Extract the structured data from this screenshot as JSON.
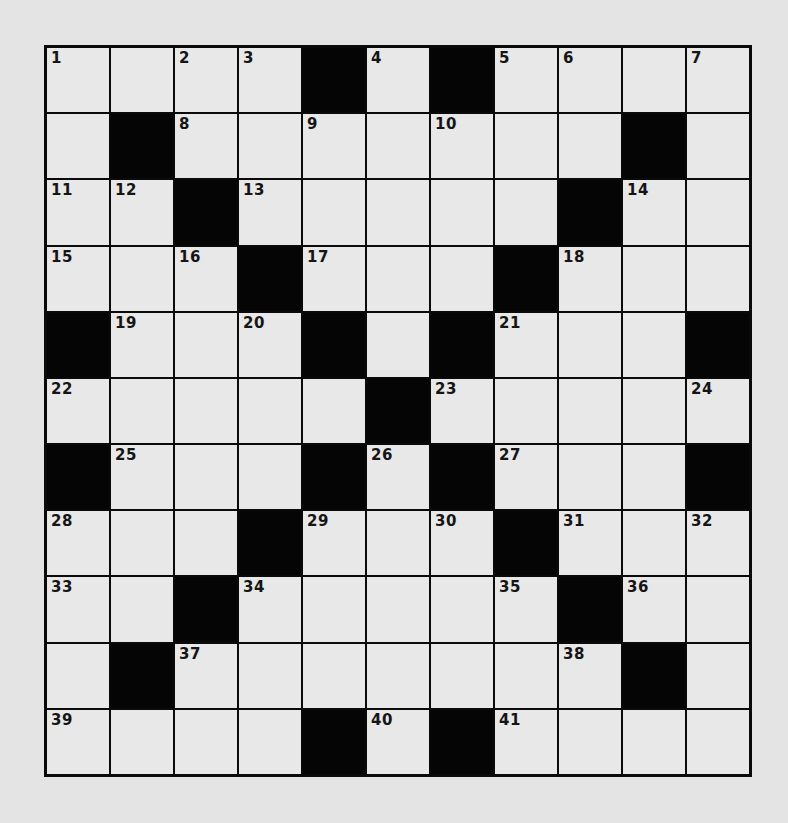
{
  "puzzle": {
    "rows": 11,
    "cols": 11,
    "colors": {
      "background": "#e4e4e4",
      "cell": "#e8e8e8",
      "block": "#050505",
      "border": "#0a0a0a"
    },
    "grid": [
      [
        {
          "n": "1"
        },
        {
          "n": ""
        },
        {
          "n": "2"
        },
        {
          "n": "3"
        },
        {
          "b": true
        },
        {
          "n": "4"
        },
        {
          "b": true
        },
        {
          "n": "5"
        },
        {
          "n": "6"
        },
        {
          "n": ""
        },
        {
          "n": "7"
        }
      ],
      [
        {
          "n": ""
        },
        {
          "b": true
        },
        {
          "n": "8"
        },
        {
          "n": ""
        },
        {
          "n": "9"
        },
        {
          "n": ""
        },
        {
          "n": "10"
        },
        {
          "n": ""
        },
        {
          "n": ""
        },
        {
          "b": true
        },
        {
          "n": ""
        }
      ],
      [
        {
          "n": "11"
        },
        {
          "n": "12"
        },
        {
          "b": true
        },
        {
          "n": "13"
        },
        {
          "n": ""
        },
        {
          "n": ""
        },
        {
          "n": ""
        },
        {
          "n": ""
        },
        {
          "b": true
        },
        {
          "n": "14"
        },
        {
          "n": ""
        }
      ],
      [
        {
          "n": "15"
        },
        {
          "n": ""
        },
        {
          "n": "16"
        },
        {
          "b": true
        },
        {
          "n": "17"
        },
        {
          "n": ""
        },
        {
          "n": ""
        },
        {
          "b": true
        },
        {
          "n": "18"
        },
        {
          "n": ""
        },
        {
          "n": ""
        }
      ],
      [
        {
          "b": true
        },
        {
          "n": "19"
        },
        {
          "n": ""
        },
        {
          "n": "20"
        },
        {
          "b": true
        },
        {
          "n": ""
        },
        {
          "b": true
        },
        {
          "n": "21"
        },
        {
          "n": ""
        },
        {
          "n": ""
        },
        {
          "b": true
        }
      ],
      [
        {
          "n": "22"
        },
        {
          "n": ""
        },
        {
          "n": ""
        },
        {
          "n": ""
        },
        {
          "n": ""
        },
        {
          "b": true
        },
        {
          "n": "23"
        },
        {
          "n": ""
        },
        {
          "n": ""
        },
        {
          "n": ""
        },
        {
          "n": "24"
        }
      ],
      [
        {
          "b": true
        },
        {
          "n": "25"
        },
        {
          "n": ""
        },
        {
          "n": ""
        },
        {
          "b": true
        },
        {
          "n": "26"
        },
        {
          "b": true
        },
        {
          "n": "27"
        },
        {
          "n": ""
        },
        {
          "n": ""
        },
        {
          "b": true
        }
      ],
      [
        {
          "n": "28"
        },
        {
          "n": ""
        },
        {
          "n": ""
        },
        {
          "b": true
        },
        {
          "n": "29"
        },
        {
          "n": ""
        },
        {
          "n": "30"
        },
        {
          "b": true
        },
        {
          "n": "31"
        },
        {
          "n": ""
        },
        {
          "n": "32"
        }
      ],
      [
        {
          "n": "33"
        },
        {
          "n": ""
        },
        {
          "b": true
        },
        {
          "n": "34"
        },
        {
          "n": ""
        },
        {
          "n": ""
        },
        {
          "n": ""
        },
        {
          "n": "35"
        },
        {
          "b": true
        },
        {
          "n": "36"
        },
        {
          "n": ""
        }
      ],
      [
        {
          "n": ""
        },
        {
          "b": true
        },
        {
          "n": "37"
        },
        {
          "n": ""
        },
        {
          "n": ""
        },
        {
          "n": ""
        },
        {
          "n": ""
        },
        {
          "n": ""
        },
        {
          "n": "38"
        },
        {
          "b": true
        },
        {
          "n": ""
        }
      ],
      [
        {
          "n": "39"
        },
        {
          "n": ""
        },
        {
          "n": ""
        },
        {
          "n": ""
        },
        {
          "b": true
        },
        {
          "n": "40"
        },
        {
          "b": true
        },
        {
          "n": "41"
        },
        {
          "n": ""
        },
        {
          "n": ""
        },
        {
          "n": ""
        }
      ]
    ]
  }
}
